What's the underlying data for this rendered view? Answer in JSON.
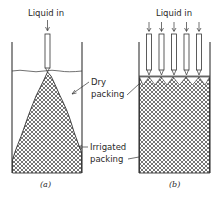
{
  "figure": {
    "panel_a": {
      "caption": "(a)",
      "inlet_label": "Liquid in",
      "feed_points": 1,
      "dry_label_line1": "Dry",
      "dry_label_line2": "packing",
      "irrigated_label_line1": "Irrigated",
      "irrigated_label_line2": "packing"
    },
    "panel_b": {
      "caption": "(b)",
      "inlet_label": "Liquid in",
      "feed_points": 5
    },
    "colors": {
      "line": "#333333",
      "text": "#2a2a2a",
      "background": "#ffffff"
    }
  }
}
